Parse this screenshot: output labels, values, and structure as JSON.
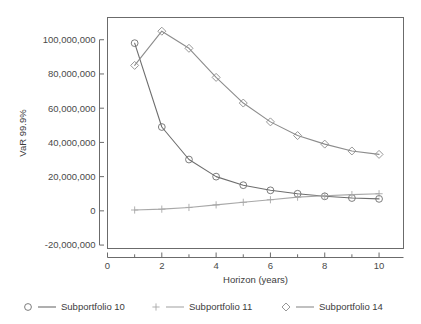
{
  "chart_data": {
    "type": "line",
    "title": "",
    "xlabel": "Horizon (years)",
    "ylabel": "VaR 99.9%",
    "x": [
      1,
      2,
      3,
      4,
      5,
      6,
      7,
      8,
      9,
      10
    ],
    "xlim": [
      0,
      10.9
    ],
    "ylim": [
      -22000000,
      113000000
    ],
    "xticks": [
      0,
      2,
      4,
      6,
      8,
      10
    ],
    "xtick_labels": [
      "0",
      "2",
      "4",
      "6",
      "8",
      "10"
    ],
    "xminor_ticks": [
      1,
      3,
      5,
      7,
      9
    ],
    "yticks": [
      -20000000,
      0,
      20000000,
      40000000,
      60000000,
      80000000,
      100000000
    ],
    "ytick_labels": [
      "-20,000,000",
      "0",
      "20,000,000",
      "40,000,000",
      "60,000,000",
      "80,000,000",
      "100,000,000"
    ],
    "grid": false,
    "legend_position": "bottom",
    "series": [
      {
        "name": "Subportfolio 10",
        "marker": "circle",
        "color": "#6e6e6e",
        "values": [
          98000000,
          49000000,
          30000000,
          20000000,
          15000000,
          12000000,
          10000000,
          8500000,
          7500000,
          7000000
        ]
      },
      {
        "name": "Subportfolio 11",
        "marker": "plus",
        "color": "#a8a8a8",
        "values": [
          500000,
          1000000,
          2000000,
          3500000,
          5000000,
          6500000,
          8000000,
          8800000,
          9500000,
          10000000
        ]
      },
      {
        "name": "Subportfolio 14",
        "marker": "diamond",
        "color": "#8c8c8c",
        "values": [
          85000000,
          105000000,
          95000000,
          78000000,
          63000000,
          52000000,
          44000000,
          39000000,
          35000000,
          33000000
        ]
      }
    ]
  },
  "axes": {
    "y_title": "VaR 99.9%",
    "x_title": "Horizon (years)"
  },
  "legend": {
    "items": [
      {
        "label": "Subportfolio 10",
        "marker": "circle-marker",
        "color": "#6e6e6e"
      },
      {
        "label": "Subportfolio 11",
        "marker": "plus-marker",
        "color": "#a8a8a8"
      },
      {
        "label": "Subportfolio 14",
        "marker": "diamond-marker",
        "color": "#8c8c8c"
      }
    ]
  },
  "colors": {
    "frame": "#6b6b6b",
    "axis": "#6b6b6b",
    "text": "#3c3c3c",
    "background": "#ffffff"
  }
}
